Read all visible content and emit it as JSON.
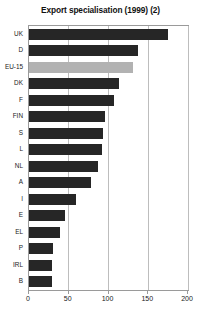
{
  "chart_data": {
    "type": "bar",
    "orientation": "horizontal",
    "title": "Export specialisation (1999) (2)",
    "xlabel": "",
    "ylabel": "",
    "categories": [
      "UK",
      "D",
      "EU-15",
      "DK",
      "F",
      "FIN",
      "S",
      "L",
      "NL",
      "A",
      "I",
      "E",
      "EL",
      "P",
      "IRL",
      "B"
    ],
    "values": [
      175,
      138,
      131,
      114,
      107,
      96,
      94,
      92,
      88,
      78,
      60,
      46,
      40,
      31,
      30,
      29
    ],
    "highlight_category": "EU-15",
    "xlim": [
      0,
      200
    ],
    "xticks": [
      0,
      50,
      100,
      150,
      200
    ],
    "xticklabels": [
      "0",
      "50",
      "100",
      "150",
      "200"
    ],
    "grid": true,
    "grid_axis": "x",
    "legend": false,
    "bar_color": "#262626",
    "highlight_color": "#b2b2b2",
    "frame_color": "#9a9a9a",
    "gridline_color": "#bdbdbd",
    "background": "#ffffff"
  }
}
